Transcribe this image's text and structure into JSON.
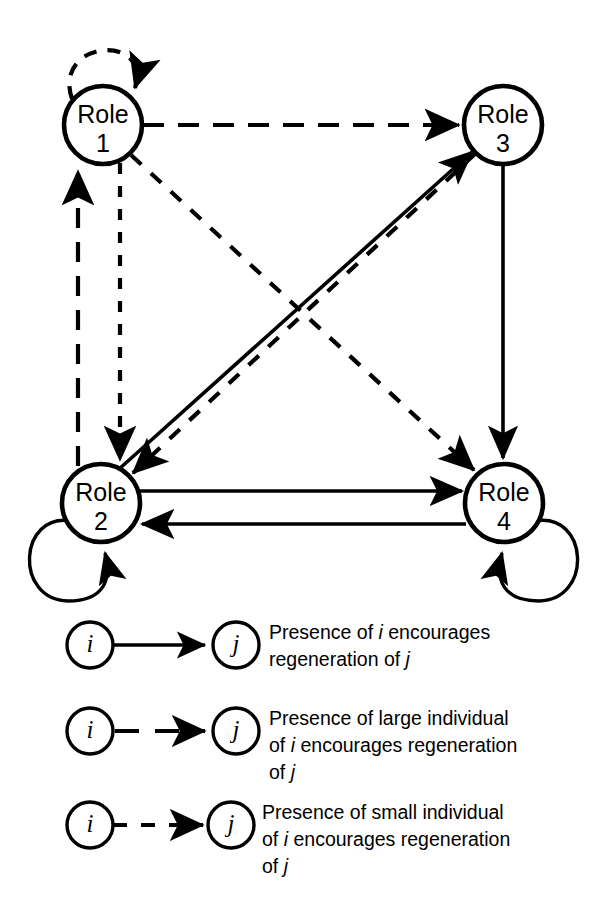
{
  "figure": {
    "stroke_color": "#000000",
    "background_color": "#ffffff"
  },
  "nodes": [
    {
      "id": "role1",
      "name": "Role",
      "number": "1",
      "cx": 103,
      "cy": 125,
      "r": 39
    },
    {
      "id": "role3",
      "name": "Role",
      "number": "3",
      "cx": 503,
      "cy": 125,
      "r": 39
    },
    {
      "id": "role2",
      "name": "Role",
      "number": "2",
      "cx": 101,
      "cy": 503,
      "r": 39
    },
    {
      "id": "role4",
      "name": "Role",
      "number": "4",
      "cx": 504,
      "cy": 503,
      "r": 39
    }
  ],
  "edges": [
    {
      "id": "e-1-1",
      "from": "role1",
      "to": "role1",
      "style": "large-dashed",
      "kind": "self-loop",
      "label": "Role 1 self loop, large individual"
    },
    {
      "id": "e-1-3",
      "from": "role1",
      "to": "role3",
      "style": "large-dashed",
      "kind": "straight",
      "label": "Role 1 to Role 3, large individual"
    },
    {
      "id": "e-1-2",
      "from": "role1",
      "to": "role2",
      "style": "small-dashed",
      "kind": "straight",
      "label": "Role 1 to Role 2, small individual"
    },
    {
      "id": "e-2-1",
      "from": "role2",
      "to": "role1",
      "style": "large-dashed",
      "kind": "straight",
      "label": "Role 2 to Role 1, large individual"
    },
    {
      "id": "e-1-4",
      "from": "role1",
      "to": "role4",
      "style": "small-dashed",
      "kind": "diagonal",
      "label": "Role 1 to Role 4, small individual"
    },
    {
      "id": "e-3-2",
      "from": "role3",
      "to": "role2",
      "style": "small-dashed",
      "kind": "diagonal",
      "label": "Role 3 to Role 2, small individual"
    },
    {
      "id": "e-2-3",
      "from": "role2",
      "to": "role3",
      "style": "solid",
      "kind": "diagonal",
      "label": "Role 2 to Role 3, presence"
    },
    {
      "id": "e-3-4",
      "from": "role3",
      "to": "role4",
      "style": "solid",
      "kind": "straight",
      "label": "Role 3 to Role 4, presence"
    },
    {
      "id": "e-2-4",
      "from": "role2",
      "to": "role4",
      "style": "solid",
      "kind": "straight",
      "label": "Role 2 to Role 4, presence"
    },
    {
      "id": "e-4-2",
      "from": "role4",
      "to": "role2",
      "style": "solid",
      "kind": "straight",
      "label": "Role 4 to Role 2, presence"
    },
    {
      "id": "e-2-2",
      "from": "role2",
      "to": "role2",
      "style": "solid",
      "kind": "self-loop",
      "label": "Role 2 self loop, presence"
    },
    {
      "id": "e-4-4",
      "from": "role4",
      "to": "role4",
      "style": "solid",
      "kind": "self-loop",
      "label": "Role 4 self loop, presence"
    }
  ],
  "legend": {
    "items": [
      {
        "id": "legend-solid",
        "style": "solid",
        "source_label": "i",
        "target_label": "j",
        "lines": [
          [
            {
              "t": "Presence of ",
              "i": false
            },
            {
              "t": "i ",
              "i": true
            },
            {
              "t": "encourages",
              "i": false
            }
          ],
          [
            {
              "t": "regeneration of ",
              "i": false
            },
            {
              "t": "j",
              "i": true
            }
          ]
        ]
      },
      {
        "id": "legend-large-dashed",
        "style": "large-dashed",
        "source_label": "i",
        "target_label": "j",
        "lines": [
          [
            {
              "t": "Presence of large individual",
              "i": false
            }
          ],
          [
            {
              "t": "of ",
              "i": false
            },
            {
              "t": "i ",
              "i": true
            },
            {
              "t": "encourages regeneration",
              "i": false
            }
          ],
          [
            {
              "t": "of ",
              "i": false
            },
            {
              "t": "j",
              "i": true
            }
          ]
        ]
      },
      {
        "id": "legend-small-dashed",
        "style": "small-dashed",
        "source_label": "i",
        "target_label": "j",
        "lines": [
          [
            {
              "t": "Presence of small individual",
              "i": false
            }
          ],
          [
            {
              "t": "of ",
              "i": false
            },
            {
              "t": "i ",
              "i": true
            },
            {
              "t": "encourages regeneration",
              "i": false
            }
          ],
          [
            {
              "t": "of ",
              "i": false
            },
            {
              "t": "j",
              "i": true
            }
          ]
        ]
      }
    ]
  }
}
